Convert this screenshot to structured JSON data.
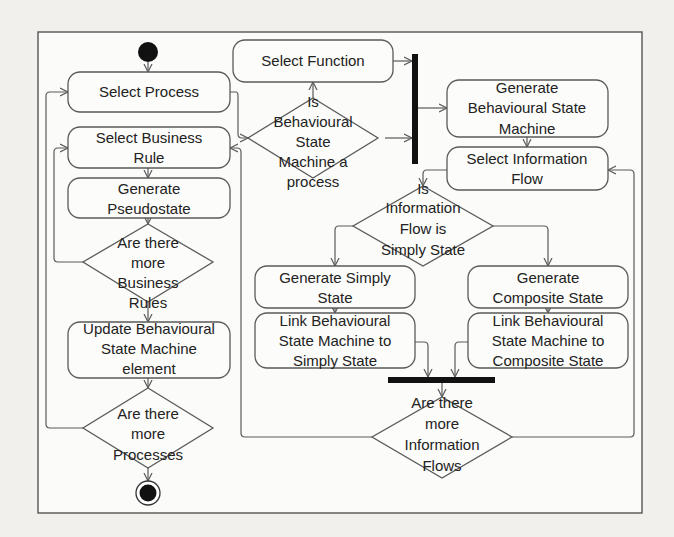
{
  "diagram": {
    "type": "UML activity diagram",
    "nodes": {
      "select_process": {
        "lines": [
          "Select Process"
        ]
      },
      "select_business_rule": {
        "lines": [
          "Select Business",
          "Rule"
        ]
      },
      "generate_pseudostate": {
        "lines": [
          "Generate",
          "Pseudostate"
        ]
      },
      "more_business_rules": {
        "lines": [
          "Are there",
          "more",
          "Business",
          "Rules"
        ]
      },
      "update_bsm_element": {
        "lines": [
          "Update Behavioural",
          "State Machine",
          "element"
        ]
      },
      "more_processes": {
        "lines": [
          "Are there",
          "more",
          "Processes"
        ]
      },
      "select_function": {
        "lines": [
          "Select Function"
        ]
      },
      "is_bsm_process": {
        "lines": [
          "Is",
          "Behavioural",
          "State",
          "Machine a",
          "process"
        ]
      },
      "generate_bsm": {
        "lines": [
          "Generate",
          "Behavioural State",
          "Machine"
        ]
      },
      "select_information_flow": {
        "lines": [
          "Select Information",
          "Flow"
        ]
      },
      "is_flow_simply_state": {
        "lines": [
          "Is",
          "Information",
          "Flow is",
          "Simply State"
        ]
      },
      "generate_simply_state": {
        "lines": [
          "Generate Simply",
          "State"
        ]
      },
      "link_bsm_simply": {
        "lines": [
          "Link Behavioural",
          "State Machine to",
          "Simply State"
        ]
      },
      "generate_composite_state": {
        "lines": [
          "Generate",
          "Composite State"
        ]
      },
      "link_bsm_composite": {
        "lines": [
          "Link Behavioural",
          "State Machine to",
          "Composite State"
        ]
      },
      "more_information_flows": {
        "lines": [
          "Are there",
          "more",
          "Information",
          "Flows"
        ]
      }
    },
    "colors": {
      "stroke": "#5a5a5a",
      "bar": "#111111",
      "background": "#f1f0ec"
    }
  }
}
